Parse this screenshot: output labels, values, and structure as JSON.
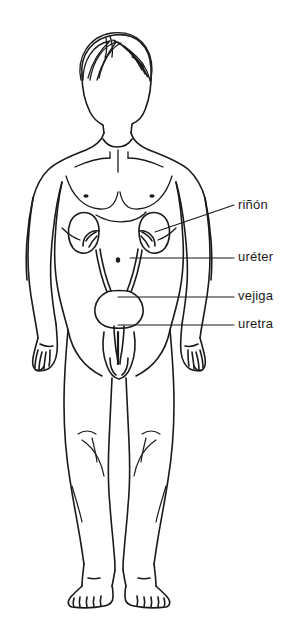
{
  "figure": {
    "background_color": "#ffffff",
    "stroke_color": "#1a1a1a",
    "width": 295,
    "height": 633
  },
  "labels": [
    {
      "id": "rinon",
      "text": "riñón",
      "organ": "kidney",
      "leader_line": "diagonal",
      "text_x": 238,
      "text_y": 197
    },
    {
      "id": "ureter",
      "text": "uréter",
      "organ": "ureter",
      "leader_line": "horizontal",
      "text_x": 238,
      "text_y": 249
    },
    {
      "id": "vejiga",
      "text": "vejiga",
      "organ": "bladder",
      "leader_line": "horizontal",
      "text_x": 238,
      "text_y": 288
    },
    {
      "id": "uretra",
      "text": "uretra",
      "organ": "urethra",
      "leader_line": "horizontal",
      "text_x": 238,
      "text_y": 316
    }
  ],
  "organs": [
    {
      "name": "kidney-left",
      "label_ref": "rinon"
    },
    {
      "name": "kidney-right",
      "label_ref": "rinon"
    },
    {
      "name": "ureter-left",
      "label_ref": "ureter"
    },
    {
      "name": "ureter-right",
      "label_ref": "ureter"
    },
    {
      "name": "bladder",
      "label_ref": "vejiga"
    },
    {
      "name": "urethra",
      "label_ref": "uretra"
    }
  ]
}
